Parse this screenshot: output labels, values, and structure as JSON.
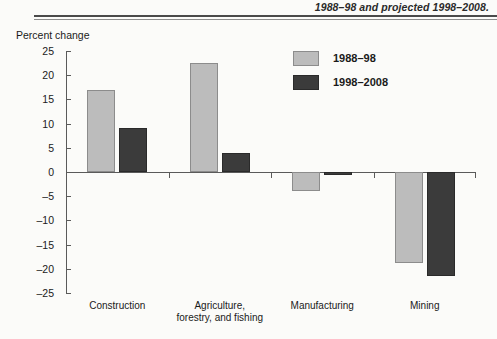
{
  "header": {
    "title": "1988–98 and projected 1998–2008."
  },
  "axis_title": "Percent change",
  "legend": {
    "items": [
      {
        "label": "1988–98",
        "color": "#bcbcbc"
      },
      {
        "label": "1998–2008",
        "color": "#3b3b3b"
      }
    ]
  },
  "chart_data": {
    "type": "bar",
    "title": "1988–98 and projected 1998–2008.",
    "xlabel": "",
    "ylabel": "Percent change",
    "ylim": [
      -25,
      25
    ],
    "yticks": [
      25,
      20,
      15,
      10,
      5,
      0,
      -5,
      -10,
      -15,
      -20,
      -25
    ],
    "ytick_labels": [
      "25",
      "20",
      "15",
      "10",
      "5",
      "0",
      "–5",
      "–10",
      "–15",
      "–20",
      "–25"
    ],
    "grid": false,
    "legend_position": "upper right",
    "categories": [
      "Construction",
      "Agriculture,\nforestry, and fishing",
      "Manufacturing",
      "Mining"
    ],
    "series": [
      {
        "name": "1988–98",
        "color": "#bcbcbc",
        "values": [
          17,
          22.5,
          -4,
          -18.7
        ]
      },
      {
        "name": "1998–2008",
        "color": "#3b3b3b",
        "values": [
          9,
          4,
          -0.7,
          -21.5
        ]
      }
    ]
  }
}
